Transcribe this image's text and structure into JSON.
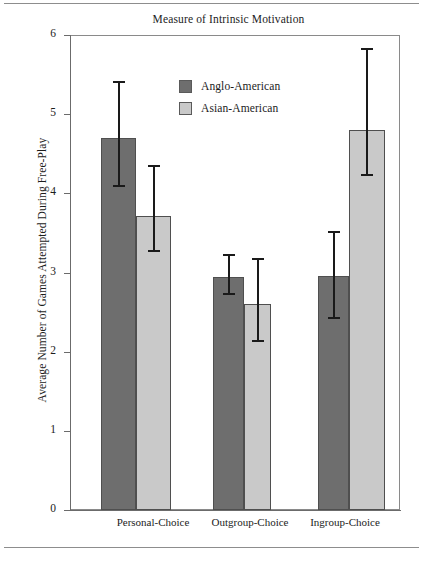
{
  "chart_data": {
    "type": "bar",
    "title": "Measure of Intrinsic Motivation",
    "xlabel": "",
    "ylabel": "Average Number of Games Attempted During Free-Play",
    "categories": [
      "Personal-Choice",
      "Outgroup-Choice",
      "Ingroup-Choice"
    ],
    "ylim": [
      0,
      6
    ],
    "yticks": [
      0,
      1,
      2,
      3,
      4,
      5,
      6
    ],
    "ytick_labels": [
      "0",
      "1",
      "2",
      "3",
      "4",
      "5",
      "6"
    ],
    "grid": false,
    "legend_position": "upper center inside",
    "series": [
      {
        "name": "Anglo-American",
        "color": "#6e6e6e",
        "values": [
          4.7,
          2.94,
          2.96
        ],
        "error_upper": [
          5.42,
          3.23,
          3.53
        ],
        "error_lower": [
          4.1,
          2.74,
          2.44
        ]
      },
      {
        "name": "Asian-American",
        "color": "#c9c9c9",
        "values": [
          3.72,
          2.6,
          4.8
        ],
        "error_upper": [
          4.36,
          3.18,
          5.84
        ],
        "error_lower": [
          3.28,
          2.15,
          4.25
        ]
      }
    ]
  },
  "figure": {
    "frame_color": "#8a8a8a",
    "axis_color": "#6b6b6b",
    "error_bar_color": "#1a1a1a",
    "background": "#ffffff"
  }
}
